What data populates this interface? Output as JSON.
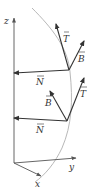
{
  "diagram": {
    "colors": {
      "axis": "#555555",
      "vector": "#333333",
      "curve": "#b8b8b8",
      "background": "#ffffff"
    },
    "axes": {
      "z_label": "z",
      "y_label": "y",
      "x_label": "x"
    },
    "frames": [
      {
        "position": "upper",
        "T_label": "T",
        "B_label": "B",
        "N_label": "N"
      },
      {
        "position": "lower",
        "T_label": "T",
        "B_label": "B",
        "N_label": "N"
      }
    ]
  }
}
